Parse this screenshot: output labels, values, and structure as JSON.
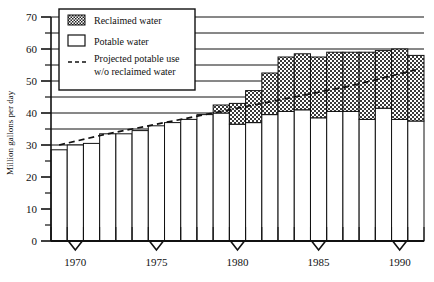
{
  "chart_data": {
    "type": "bar",
    "subtype": "stacked-bar-with-line",
    "title": "",
    "xlabel": "",
    "ylabel": "Million gallons per day",
    "ylim": [
      0,
      70
    ],
    "ytick_step": 10,
    "yminor_step": 5,
    "grid": true,
    "xlim": [
      1969,
      1992
    ],
    "xtick_labels": [
      "1970",
      "1975",
      "1980",
      "1985",
      "1990"
    ],
    "xticks": [
      1970,
      1975,
      1980,
      1985,
      1990
    ],
    "legend_position": "upper-left-inside",
    "legend": [
      {
        "label": "Reclaimed water",
        "swatch": "checker-dark"
      },
      {
        "label": "Potable water",
        "swatch": "open-white"
      },
      {
        "label": "Projected potable use w/o reclaimed water",
        "swatch": "dashed-line"
      }
    ],
    "legend_entries": [
      "Reclaimed water",
      "Potable water",
      "Projected potable use",
      "w/o reclaimed water"
    ],
    "years": [
      1969,
      1970,
      1971,
      1972,
      1973,
      1974,
      1975,
      1976,
      1977,
      1978,
      1979,
      1980,
      1981,
      1982,
      1983,
      1984,
      1985,
      1986,
      1987,
      1988,
      1989,
      1990,
      1991
    ],
    "series": [
      {
        "name": "Potable water",
        "values": [
          28.5,
          30.0,
          30.5,
          33.5,
          33.5,
          34.5,
          36.0,
          37.0,
          38.0,
          39.5,
          40.0,
          36.5,
          37.0,
          39.5,
          40.5,
          41.0,
          38.5,
          40.5,
          40.5,
          38.0,
          41.5,
          38.0,
          37.5
        ]
      },
      {
        "name": "Reclaimed water",
        "values": [
          0.0,
          0.0,
          0.0,
          0.0,
          0.0,
          0.0,
          0.0,
          0.0,
          0.0,
          0.0,
          2.5,
          6.5,
          10.0,
          13.0,
          17.0,
          17.5,
          19.0,
          18.5,
          18.5,
          21.0,
          18.0,
          22.0,
          20.5
        ]
      }
    ],
    "stacked_totals": [
      28.5,
      30.0,
      30.5,
      33.5,
      33.5,
      34.5,
      36.0,
      37.0,
      38.0,
      39.5,
      42.5,
      43.0,
      47.0,
      52.5,
      57.5,
      58.5,
      57.5,
      59.0,
      59.0,
      59.0,
      59.5,
      60.0,
      58.0
    ],
    "projection_line": {
      "name": "Projected potable use w/o reclaimed water",
      "style": "dashed",
      "x": [
        1969,
        1991
      ],
      "y": [
        30.0,
        53.5
      ],
      "points": [
        {
          "year": 1969,
          "value": 30.0
        },
        {
          "year": 1972,
          "value": 33.5
        },
        {
          "year": 1975,
          "value": 36.5
        },
        {
          "year": 1978,
          "value": 39.5
        },
        {
          "year": 1981,
          "value": 42.5
        },
        {
          "year": 1984,
          "value": 45.5
        },
        {
          "year": 1987,
          "value": 48.5
        },
        {
          "year": 1991,
          "value": 53.5
        }
      ]
    }
  }
}
